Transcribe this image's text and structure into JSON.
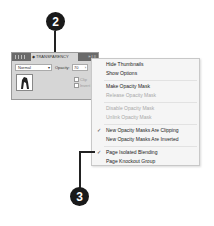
{
  "callouts": [
    {
      "label": "2"
    },
    {
      "label": "3"
    }
  ],
  "panel": {
    "grip_icon": "panel-grip-icon",
    "tab_label": "◆ TRANSPARENCY",
    "tab_controls": "» | ≡",
    "blend_mode": "Normal",
    "opacity_label": "Opacity:",
    "opacity_value": "70",
    "dropdown_caret": "▾",
    "field_caret": "›",
    "clip_label": "Clip",
    "invert_mask_label": "Invert Mask"
  },
  "menu": {
    "check_glyph": "✓",
    "items": [
      {
        "label": "Hide Thumbnails",
        "enabled": true,
        "checked": false
      },
      {
        "label": "Show Options",
        "enabled": true,
        "checked": false
      },
      {
        "label": "Make Opacity Mask",
        "enabled": true,
        "checked": false
      },
      {
        "label": "Release Opacity Mask",
        "enabled": false,
        "checked": false
      },
      {
        "label": "Disable Opacity Mask",
        "enabled": false,
        "checked": false
      },
      {
        "label": "Unlink Opacity Mask",
        "enabled": false,
        "checked": false
      },
      {
        "label": "New Opacity Masks Are Clipping",
        "enabled": true,
        "checked": true
      },
      {
        "label": "New Opacity Masks Are Inverted",
        "enabled": true,
        "checked": false
      },
      {
        "label": "Page Isolated Blending",
        "enabled": true,
        "checked": true
      },
      {
        "label": "Page Knockout Group",
        "enabled": true,
        "checked": false
      }
    ]
  }
}
